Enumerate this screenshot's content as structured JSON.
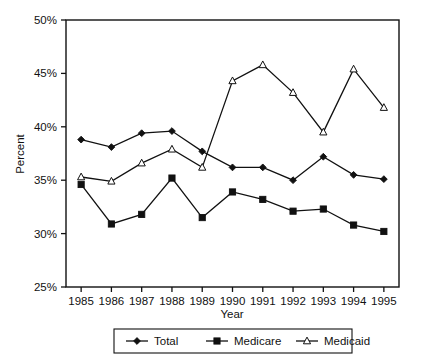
{
  "chart_data": {
    "type": "line",
    "title": "",
    "subtitle": "",
    "xlabel": "Year",
    "ylabel": "Percent",
    "categories": [
      "1985",
      "1986",
      "1987",
      "1988",
      "1989",
      "1990",
      "1991",
      "1992",
      "1993",
      "1994",
      "1995"
    ],
    "x": [
      1985,
      1986,
      1987,
      1988,
      1989,
      1990,
      1991,
      1992,
      1993,
      1994,
      1995
    ],
    "xlim": [
      1984.5,
      1995.5
    ],
    "ylim": [
      25,
      50
    ],
    "ytick_labels": [
      "50%",
      "45%",
      "40%",
      "35%",
      "30%",
      "25%"
    ],
    "ytick_values": [
      50,
      45,
      40,
      35,
      30,
      25
    ],
    "grid": false,
    "legend_position": "bottom",
    "series": [
      {
        "name": "Total",
        "marker": "filled-diamond",
        "values": [
          38.8,
          38.1,
          39.4,
          39.6,
          37.7,
          36.2,
          36.2,
          35.0,
          37.2,
          35.5,
          35.1
        ]
      },
      {
        "name": "Medicare",
        "marker": "filled-square",
        "values": [
          34.6,
          30.9,
          31.8,
          35.2,
          31.5,
          33.9,
          33.2,
          32.1,
          32.3,
          30.8,
          30.2
        ]
      },
      {
        "name": "Medicaid",
        "marker": "open-triangle",
        "values": [
          35.3,
          34.9,
          36.6,
          37.9,
          36.2,
          44.3,
          45.8,
          43.2,
          39.5,
          45.4,
          41.8
        ]
      }
    ],
    "colors": {
      "line": "#111111",
      "marker_fill": "#111111",
      "marker_open_fill": "#ffffff",
      "axis": "#111111",
      "background": "#ffffff"
    }
  },
  "axes": {
    "y_title": "Percent",
    "x_title": "Year"
  },
  "legend": {
    "entries": [
      {
        "label": "Total",
        "marker": "filled-diamond"
      },
      {
        "label": "Medicare",
        "marker": "filled-square"
      },
      {
        "label": "Medicaid",
        "marker": "open-triangle"
      }
    ]
  }
}
